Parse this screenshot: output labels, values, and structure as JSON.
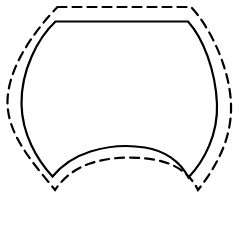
{
  "document": {
    "title": "Pattern Piece Outline",
    "background_color": "#ffffff",
    "width": 240,
    "height": 227
  },
  "figure": {
    "name": "barrel-shield-pattern-outline",
    "stroke_color": "#000000",
    "solid": {
      "label": "cutting-line-solid",
      "stroke_width": 2.2,
      "dash_pattern": "none",
      "path": "M 55.5 21.5 L 188 21.5 C 203 38 215.5 70 217 104 C 218 134 205 160 188.5 177.5 C 180 161 164 150.5 145 147.5 C 128 144.8 108 146 90.5 151.5 C 75 156.4 62 165 52.5 176.5 C 37 160 22 134 21.5 104 C 21 70 38 38 55.5 21.5 Z"
    },
    "dashed": {
      "label": "seam-allowance-dashed",
      "stroke_width": 2.2,
      "dash_pattern": "9 6",
      "path": "M 57.5 7 L 191 7 C 209 26 229.5 66 231 104 C 232.3 137.5 217 166 198 190 C 189 172 174 163.5 156 160 C 133 155.8 110 157 90 163.5 C 75.5 168.3 64 177 55 190 C 36 166 8.5 137.5 7.5 104 C 6.5 66 39 26 57.5 7 Z"
    }
  },
  "chart_data": {
    "type": "line",
    "xlabel": "",
    "ylabel": "",
    "series": [
      {
        "name": "Cutting line (solid)",
        "style": "solid",
        "closed": true,
        "color": "#000000",
        "points": [
          [
            55.5,
            21.5
          ],
          [
            188.0,
            21.5
          ],
          [
            213.0,
            62.0
          ],
          [
            217.0,
            104.0
          ],
          [
            205.0,
            152.0
          ],
          [
            188.5,
            177.5
          ],
          [
            145.0,
            147.5
          ],
          [
            90.5,
            151.5
          ],
          [
            52.5,
            176.5
          ],
          [
            30.0,
            140.0
          ],
          [
            21.5,
            104.0
          ],
          [
            30.0,
            58.0
          ]
        ]
      },
      {
        "name": "Seam allowance (dashed)",
        "style": "dashed",
        "closed": true,
        "color": "#000000",
        "points": [
          [
            57.5,
            7.0
          ],
          [
            191.0,
            7.0
          ],
          [
            224.0,
            52.0
          ],
          [
            231.0,
            104.0
          ],
          [
            216.0,
            163.0
          ],
          [
            198.0,
            190.0
          ],
          [
            156.0,
            160.0
          ],
          [
            90.0,
            163.5
          ],
          [
            55.0,
            190.0
          ],
          [
            24.0,
            152.0
          ],
          [
            7.5,
            104.0
          ],
          [
            20.0,
            46.0
          ]
        ]
      }
    ],
    "xlim": [
      0,
      240
    ],
    "ylim": [
      0,
      227
    ],
    "grid": false,
    "legend": "none"
  }
}
